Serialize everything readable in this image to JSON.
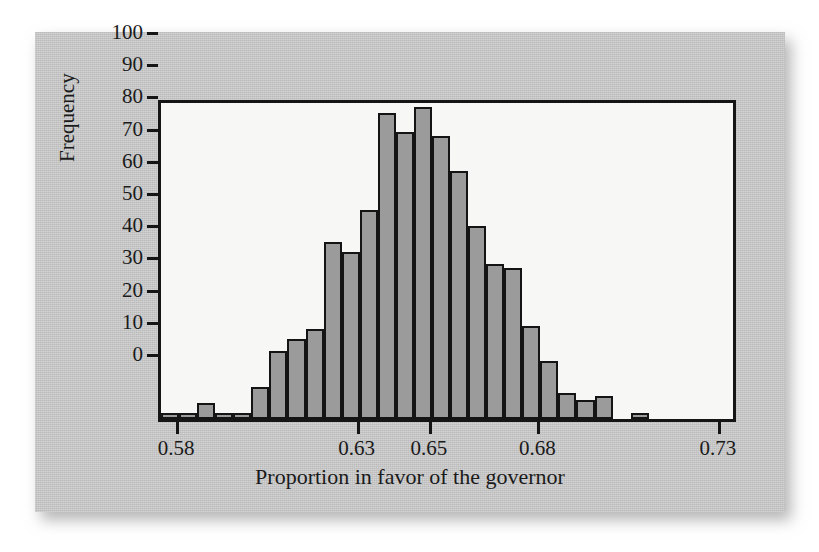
{
  "chart_data": {
    "type": "bar",
    "title": "",
    "xlabel": "Proportion in favor of the governor",
    "ylabel": "Frequency",
    "xlim": [
      0.575,
      0.735
    ],
    "ylim": [
      0,
      100
    ],
    "grid": false,
    "legend": "none",
    "bin_width": 0.005,
    "bin_starts": [
      0.575,
      0.58,
      0.585,
      0.59,
      0.595,
      0.6,
      0.605,
      0.61,
      0.615,
      0.62,
      0.625,
      0.63,
      0.635,
      0.64,
      0.645,
      0.65,
      0.655,
      0.66,
      0.665,
      0.67,
      0.675,
      0.68,
      0.685,
      0.69,
      0.695,
      0.7,
      0.705
    ],
    "categories": [
      "0.575-0.580",
      "0.580-0.585",
      "0.585-0.590",
      "0.590-0.595",
      "0.595-0.600",
      "0.600-0.605",
      "0.605-0.610",
      "0.610-0.615",
      "0.615-0.620",
      "0.620-0.625",
      "0.625-0.630",
      "0.630-0.635",
      "0.635-0.640",
      "0.640-0.645",
      "0.645-0.650",
      "0.650-0.655",
      "0.655-0.660",
      "0.660-0.665",
      "0.665-0.670",
      "0.670-0.675",
      "0.675-0.680",
      "0.680-0.685",
      "0.685-0.690",
      "0.690-0.695",
      "0.695-0.700",
      "0.700-0.705",
      "0.705-0.710"
    ],
    "values": [
      2,
      2,
      5,
      2,
      2,
      10,
      21,
      25,
      28,
      55,
      52,
      65,
      95,
      89,
      97,
      88,
      77,
      60,
      48,
      47,
      29,
      18,
      8,
      6,
      7,
      0,
      2
    ],
    "ytick_values": [
      0,
      10,
      20,
      30,
      40,
      50,
      60,
      70,
      80,
      90,
      100
    ],
    "ytick_labels": [
      "0",
      "10",
      "20",
      "30",
      "40",
      "50",
      "60",
      "70",
      "80",
      "90",
      "100"
    ],
    "xtick_values": [
      0.58,
      0.63,
      0.65,
      0.68,
      0.73
    ],
    "xtick_labels": [
      "0.58",
      "0.63",
      "0.65",
      "0.68",
      "0.73"
    ],
    "bar_fill_color": "#9b9b9b",
    "bar_edge_color": "#141414",
    "plot_background_color": "#f7f7f5",
    "figure_background_color": "#c9c9c9"
  }
}
